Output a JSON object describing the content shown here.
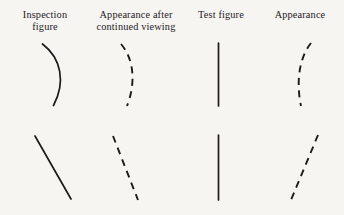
{
  "figure": {
    "background_color": "#f7f5f1",
    "ink_color": "#1d1b1a",
    "columns": [
      {
        "id": "inspection-figure",
        "header_lines": [
          "Inspection",
          "figure"
        ]
      },
      {
        "id": "appearance-after-continued-viewing",
        "header_lines": [
          "Appearance after",
          "continued viewing"
        ]
      },
      {
        "id": "test-figure",
        "header_lines": [
          "Test  figure"
        ]
      },
      {
        "id": "appearance",
        "header_lines": [
          "Appearance"
        ]
      }
    ],
    "rows": [
      {
        "id": "curved-stimulus-row",
        "cells": [
          {
            "id": "inspection-curve-solid",
            "style": "solid",
            "shape": "arc-bulging-right"
          },
          {
            "id": "aftereffect-curve-dashed",
            "style": "dashed",
            "shape": "arc-bulging-right-shallow"
          },
          {
            "id": "test-line-vertical-solid",
            "style": "solid",
            "shape": "vertical-line"
          },
          {
            "id": "aftereffect-line-dashed-curved",
            "style": "dashed",
            "shape": "arc-bulging-left"
          }
        ]
      },
      {
        "id": "tilted-stimulus-row",
        "cells": [
          {
            "id": "inspection-line-tilted-solid",
            "style": "solid",
            "shape": "line-tilt-right-down"
          },
          {
            "id": "aftereffect-line-tilted-dashed",
            "style": "dashed",
            "shape": "line-tilt-right-down"
          },
          {
            "id": "test-line-vertical-solid-2",
            "style": "solid",
            "shape": "vertical-line"
          },
          {
            "id": "aftereffect-line-tilted-dashed-opposite",
            "style": "dashed",
            "shape": "line-tilt-left-down"
          }
        ]
      }
    ]
  }
}
